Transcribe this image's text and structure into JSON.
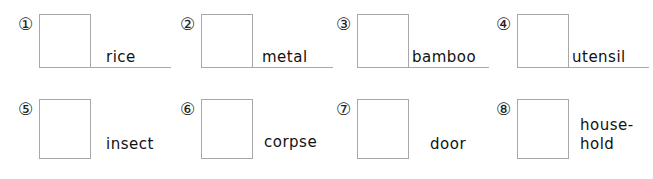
{
  "items": [
    {
      "number": "①",
      "word": "rice"
    },
    {
      "number": "②",
      "word": "metal"
    },
    {
      "number": "③",
      "word": "bamboo"
    },
    {
      "number": "④",
      "word": "utensil"
    },
    {
      "number": "⑤",
      "word": "insect"
    },
    {
      "number": "⑥",
      "word": "corpse"
    },
    {
      "number": "⑦",
      "word": "door"
    },
    {
      "number": "⑧",
      "word_line1": "house-",
      "word_line2": "hold"
    }
  ]
}
